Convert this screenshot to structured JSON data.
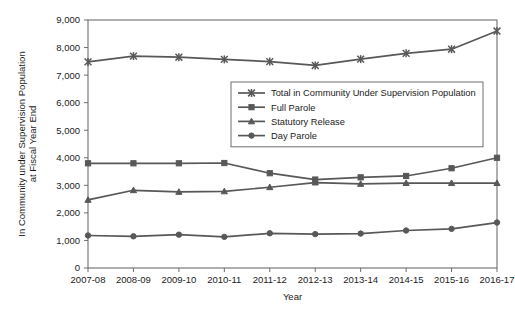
{
  "chart_data": {
    "type": "line",
    "title": "",
    "xlabel": "Year",
    "ylabel": "In Community under Supervision Population at Fiscal Year End",
    "ylabel_line1": "In Community under Supervision Population",
    "ylabel_line2": "at Fiscal Year End",
    "categories": [
      "2007-08",
      "2008-09",
      "2009-10",
      "2010-11",
      "2011-12",
      "2012-13",
      "2013-14",
      "2014-15",
      "2015-16",
      "2016-17"
    ],
    "ylim": [
      0,
      9000
    ],
    "ytick_step": 1000,
    "ytick_labels": [
      "0",
      "1,000",
      "2,000",
      "3,000",
      "4,000",
      "5,000",
      "6,000",
      "7,000",
      "8,000",
      "9,000"
    ],
    "grid": false,
    "legend_position": "inside-upper-center",
    "series": [
      {
        "name": "Total in Community Under Supervision Population",
        "marker": "x-cross",
        "color": "#585858",
        "values": [
          7480,
          7690,
          7650,
          7570,
          7490,
          7350,
          7580,
          7790,
          7940,
          8600
        ]
      },
      {
        "name": "Full Parole",
        "marker": "square",
        "color": "#585858",
        "values": [
          3800,
          3800,
          3800,
          3810,
          3440,
          3210,
          3290,
          3340,
          3620,
          4000
        ]
      },
      {
        "name": "Statutory Release",
        "marker": "triangle",
        "color": "#585858",
        "values": [
          2470,
          2820,
          2760,
          2780,
          2930,
          3100,
          3050,
          3080,
          3080,
          3080
        ]
      },
      {
        "name": "Day Parole",
        "marker": "circle",
        "color": "#585858",
        "values": [
          1180,
          1150,
          1210,
          1130,
          1260,
          1230,
          1250,
          1360,
          1420,
          1650
        ]
      }
    ]
  }
}
